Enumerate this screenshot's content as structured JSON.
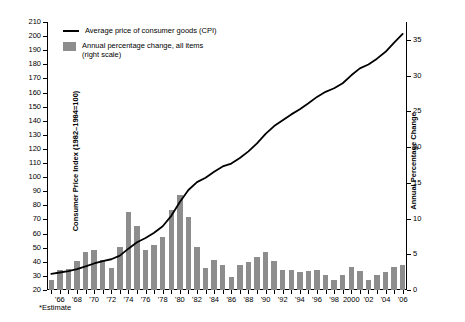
{
  "chart_data": {
    "type": "bar",
    "title": "",
    "subtitle": "",
    "xlabel": "",
    "ylabel": "Consumer Price Index (1982–1984=100)",
    "y2label": "Annual Percentage Change",
    "ylim": [
      20,
      210
    ],
    "y2lim": [
      0,
      37.5
    ],
    "grid": false,
    "legend_position": "top-left",
    "y_ticks": [
      20,
      30,
      40,
      50,
      60,
      70,
      80,
      90,
      100,
      110,
      120,
      130,
      140,
      150,
      160,
      170,
      180,
      190,
      200,
      210
    ],
    "y2_ticks": [
      0,
      5,
      10,
      15,
      20,
      25,
      30,
      35
    ],
    "x_tick_labels": [
      "'66",
      "'68",
      "'70",
      "'72",
      "'74",
      "'76",
      "'78",
      "'80",
      "'82",
      "'84",
      "'86",
      "'88",
      "'90",
      "'92",
      "'94",
      "'96",
      "'98",
      "2000",
      "'02",
      "'04",
      "'06"
    ],
    "x": [
      1965,
      1966,
      1967,
      1968,
      1969,
      1970,
      1971,
      1972,
      1973,
      1974,
      1975,
      1976,
      1977,
      1978,
      1979,
      1980,
      1981,
      1982,
      1983,
      1984,
      1985,
      1986,
      1987,
      1988,
      1989,
      1990,
      1991,
      1992,
      1993,
      1994,
      1995,
      1996,
      1997,
      1998,
      1999,
      2000,
      2001,
      2002,
      2003,
      2004,
      2005,
      2006
    ],
    "annotations": [
      "*Estimate"
    ],
    "series": [
      {
        "name": "Annual percentage change, all items\n(right scale)",
        "legend_label_line1": "Annual percentage change, all items",
        "legend_label_line2": "(right scale)",
        "type": "bar",
        "axis": "right",
        "color": "#8d8d8d",
        "values": [
          1.6,
          2.9,
          3.1,
          4.2,
          5.5,
          5.7,
          4.4,
          3.2,
          6.2,
          11.0,
          9.1,
          5.8,
          6.5,
          7.6,
          11.3,
          13.5,
          10.3,
          6.2,
          3.2,
          4.3,
          3.6,
          1.9,
          3.6,
          4.1,
          4.8,
          5.4,
          4.2,
          3.0,
          3.0,
          2.6,
          2.8,
          3.0,
          2.3,
          1.6,
          2.2,
          3.4,
          2.8,
          1.6,
          2.3,
          2.7,
          3.4,
          3.6
        ]
      },
      {
        "name": "Average price of consumer goods (CPI)",
        "legend_label_line1": "Average price of consumer goods (CPI)",
        "type": "line",
        "axis": "left",
        "color": "#000000",
        "values": [
          31.5,
          32.4,
          33.4,
          34.8,
          36.7,
          38.8,
          40.5,
          41.8,
          44.4,
          49.3,
          53.8,
          56.9,
          60.6,
          65.2,
          72.6,
          82.4,
          90.9,
          96.5,
          99.6,
          103.9,
          107.6,
          109.6,
          113.6,
          118.3,
          124.0,
          130.7,
          136.2,
          140.3,
          144.5,
          148.2,
          152.4,
          156.9,
          160.5,
          163.0,
          166.6,
          172.2,
          177.1,
          179.9,
          184.0,
          188.9,
          195.3,
          201.6
        ]
      }
    ]
  }
}
